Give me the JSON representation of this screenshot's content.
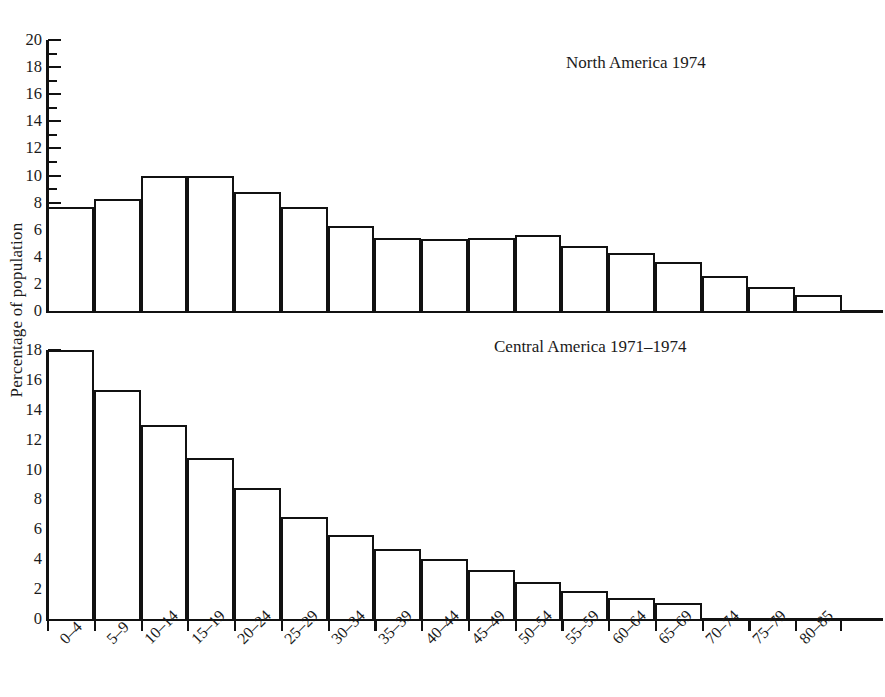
{
  "figure": {
    "ylabel": "Percentage of population"
  },
  "chart_data": [
    {
      "type": "bar",
      "title": "North America 1974",
      "xlabel": "",
      "ylabel": "Percentage of population",
      "ylim": [
        0,
        20
      ],
      "ytick_major": [
        0,
        2,
        4,
        6,
        8,
        10,
        12,
        14,
        16,
        18,
        20
      ],
      "ytick_minor": [
        1,
        3,
        5,
        7,
        9,
        11,
        13,
        15,
        17,
        19
      ],
      "grid": false,
      "legend": "none",
      "categories": [
        "0–4",
        "5–9",
        "10–14",
        "15–19",
        "20–24",
        "25–29",
        "30–34",
        "35–39",
        "40–44",
        "45–49",
        "50–54",
        "55–59",
        "60–64",
        "65–69",
        "70–74",
        "75–79",
        "80–85"
      ],
      "values": [
        7.7,
        8.3,
        10.0,
        10.0,
        8.8,
        7.7,
        6.3,
        5.4,
        5.3,
        5.4,
        5.6,
        4.8,
        4.3,
        3.6,
        2.6,
        1.8,
        1.2
      ]
    },
    {
      "type": "bar",
      "title": "Central America 1971–1974",
      "xlabel": "",
      "ylabel": "Percentage of population",
      "ylim": [
        0,
        18
      ],
      "ytick_major": [
        0,
        2,
        4,
        6,
        8,
        10,
        12,
        14,
        16,
        18
      ],
      "ytick_minor": [
        1,
        3,
        5,
        7,
        9,
        11,
        13,
        15,
        17
      ],
      "grid": false,
      "legend": "none",
      "categories": [
        "0–4",
        "5–9",
        "10–14",
        "15–19",
        "20–24",
        "25–29",
        "30–34",
        "35–39",
        "40–44",
        "45–49",
        "50–54",
        "55–59",
        "60–64",
        "65–69",
        "70–74",
        "75–79",
        "80–85"
      ],
      "values": [
        18.0,
        15.3,
        13.0,
        10.8,
        8.8,
        6.8,
        5.6,
        4.7,
        4.0,
        3.3,
        2.5,
        1.9,
        1.4,
        1.1,
        null,
        null,
        null
      ]
    }
  ],
  "style": {
    "line_color": "#111111",
    "bar_fill": "#ffffff",
    "background": "#ffffff"
  }
}
